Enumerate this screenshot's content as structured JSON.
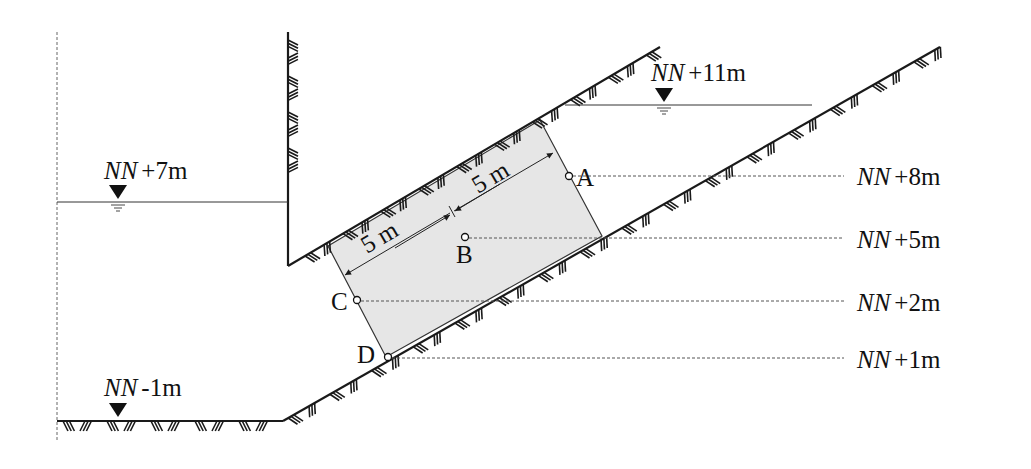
{
  "diagram": {
    "type": "geotechnical cross-section with inclined soil block",
    "colors": {
      "line": "#1a1a1a",
      "block_fill": "#e6e6e6",
      "dashed": "#555555",
      "background": "#ffffff"
    },
    "water_levels": {
      "left": {
        "nn": "NN",
        "value": "+7m"
      },
      "right": {
        "nn": "NN",
        "value": "+11m"
      },
      "bottom": {
        "nn": "NN",
        "value": "-1m"
      }
    },
    "dimensions": {
      "upper": "5 m",
      "lower": "5 m"
    },
    "points": {
      "A": "A",
      "B": "B",
      "C": "C",
      "D": "D"
    },
    "elevations": [
      {
        "nn": "NN",
        "value": "+8m",
        "point": "A"
      },
      {
        "nn": "NN",
        "value": "+5m",
        "point": "B"
      },
      {
        "nn": "NN",
        "value": "+2m",
        "point": "C"
      },
      {
        "nn": "NN",
        "value": "+1m",
        "point": "D"
      }
    ]
  }
}
